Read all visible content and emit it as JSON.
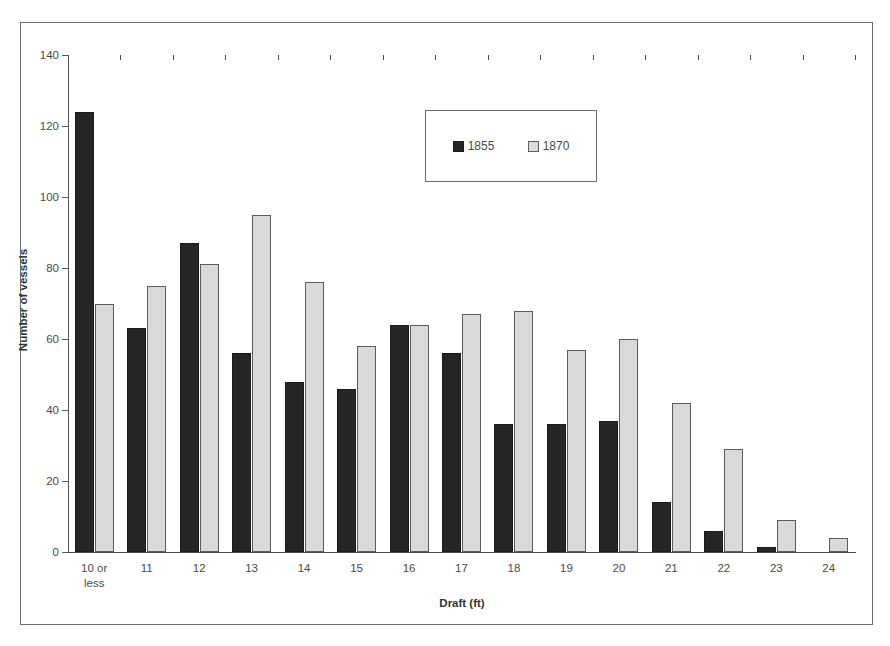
{
  "chart_data": {
    "type": "bar",
    "title": "",
    "xlabel": "Draft (ft)",
    "ylabel": "Number of vessels",
    "categories": [
      "10 or\nless",
      "11",
      "12",
      "13",
      "14",
      "15",
      "16",
      "17",
      "18",
      "19",
      "20",
      "21",
      "22",
      "23",
      "24"
    ],
    "series": [
      {
        "name": "1855",
        "color": "#262626",
        "values": [
          124,
          63,
          87,
          56,
          48,
          46,
          64,
          56,
          36,
          36,
          37,
          14,
          6,
          1.5,
          0
        ]
      },
      {
        "name": "1870",
        "color": "#d9d9d9",
        "values": [
          70,
          75,
          81,
          95,
          76,
          58,
          64,
          67,
          68,
          57,
          60,
          42,
          29,
          9,
          4
        ]
      }
    ],
    "ylim": [
      0,
      140
    ],
    "ytick_values": [
      0,
      20,
      40,
      60,
      80,
      100,
      120,
      140
    ],
    "ytick_labels": [
      "0",
      "20",
      "40",
      "60",
      "80",
      "100",
      "120",
      "140"
    ],
    "grid": false,
    "legend_position": "upper-center",
    "legend_entries": [
      "1855",
      "1870"
    ]
  }
}
